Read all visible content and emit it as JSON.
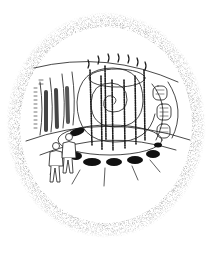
{
  "illustration": {
    "caption": "",
    "subject": "fish-eye view of a circular chamber with a central spiral, vertical columns, oval floor pads, wall panels, and two figures",
    "colors": {
      "ink": "#1a1a1a",
      "stipple": "#9a9a9a",
      "background": "#ffffff"
    },
    "elements": {
      "spiral": "central-spiral",
      "columns": 7,
      "floor_pads": 7,
      "figures": 2,
      "left_wall_bars": 3,
      "right_wall_panels": 3
    }
  }
}
